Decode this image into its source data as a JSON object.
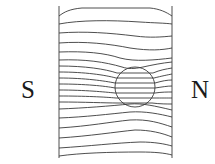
{
  "diagram": {
    "type": "magnetic-field-lines",
    "labels": {
      "south_pole": "S",
      "north_pole": "N"
    },
    "object": "circle",
    "colors": {
      "line": "#3a3a3a",
      "text": "#1a1a1a",
      "background": "#ffffff"
    }
  }
}
